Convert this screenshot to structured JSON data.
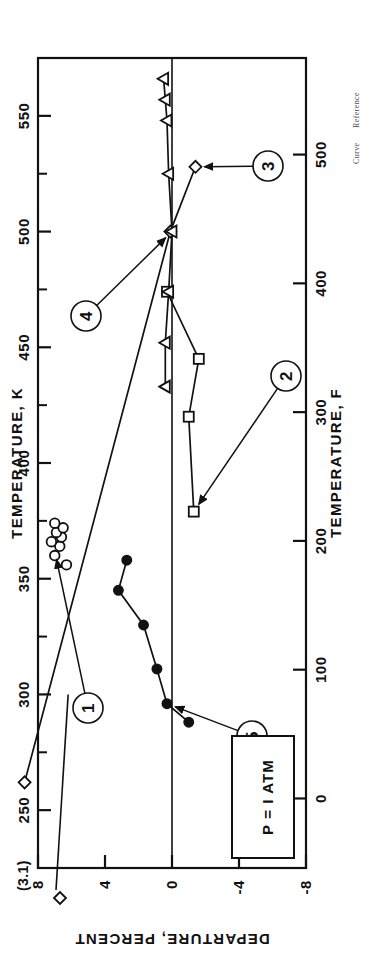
{
  "figure": {
    "note_box_label": "P = I ATM",
    "out_of_range_label": "(3.1)",
    "caption": {
      "curve_word": "Curve",
      "reference_word": "Reference"
    }
  },
  "chart_data": {
    "type": "scatter",
    "title": "",
    "xlabel": "TEMPERATURE, K",
    "xlabel_secondary": "TEMPERATURE, F",
    "ylabel": "DEPARTURE, PERCENT",
    "xlim": [
      225,
      575
    ],
    "ylim": [
      -8,
      8
    ],
    "xlim_f": [
      -54,
      575
    ],
    "grid": false,
    "legend_position": "none",
    "x_ticks_major": [
      250,
      300,
      350,
      400,
      450,
      500,
      550
    ],
    "x_ticklabels_major": [
      "250",
      "300",
      "350",
      "400",
      "450",
      "500",
      "550"
    ],
    "x_ticks_minor": [
      275,
      325,
      375,
      425,
      475,
      525
    ],
    "x_ticks_f": [
      0,
      100,
      200,
      300,
      400,
      500
    ],
    "x_ticklabels_f": [
      "0",
      "100",
      "200",
      "300",
      "400",
      "500"
    ],
    "y_ticks": [
      8,
      4,
      0,
      -4,
      -8
    ],
    "y_ticklabels": [
      "8",
      "4",
      "0",
      "-4",
      "-8"
    ],
    "zero_line": 0,
    "series": [
      {
        "name": "1",
        "marker": "open-circle",
        "connected": false,
        "callout": "1",
        "points": [
          {
            "x": 360,
            "y": 7.0
          },
          {
            "x": 364,
            "y": 6.7
          },
          {
            "x": 366,
            "y": 7.2
          },
          {
            "x": 368,
            "y": 6.6
          },
          {
            "x": 370,
            "y": 6.9
          },
          {
            "x": 372,
            "y": 6.5
          },
          {
            "x": 374,
            "y": 7.0
          },
          {
            "x": 356,
            "y": 6.3
          }
        ]
      },
      {
        "name": "2",
        "marker": "open-square",
        "connected": true,
        "callout": "2",
        "points": [
          {
            "x": 379,
            "y": -1.3
          },
          {
            "x": 420,
            "y": -1.0
          },
          {
            "x": 445,
            "y": -1.6
          },
          {
            "x": 474,
            "y": 0.3
          }
        ]
      },
      {
        "name": "3",
        "marker": "open-diamond",
        "connected": true,
        "callout": "3",
        "points": [
          {
            "x": 262,
            "y": 8.8
          },
          {
            "x": 500,
            "y": 0.1
          },
          {
            "x": 528,
            "y": -1.4
          }
        ]
      },
      {
        "name": "4",
        "marker": "open-triangle-left",
        "connected": true,
        "callout": "4",
        "points": [
          {
            "x": 433,
            "y": 0.4
          },
          {
            "x": 452,
            "y": 0.4
          },
          {
            "x": 474,
            "y": 0.2
          },
          {
            "x": 500,
            "y": 0.0
          },
          {
            "x": 525,
            "y": 0.2
          },
          {
            "x": 548,
            "y": 0.3
          },
          {
            "x": 557,
            "y": 0.4
          },
          {
            "x": 566,
            "y": 0.5
          }
        ]
      },
      {
        "name": "5",
        "marker": "filled-circle",
        "connected": true,
        "callout": "5",
        "points": [
          {
            "x": 288,
            "y": -1.0
          },
          {
            "x": 296,
            "y": 0.3
          },
          {
            "x": 311,
            "y": 0.9
          },
          {
            "x": 330,
            "y": 1.7
          },
          {
            "x": 345,
            "y": 3.2
          },
          {
            "x": 358,
            "y": 2.7
          }
        ]
      }
    ],
    "annotations": [
      {
        "text": "(3.1)",
        "x": 262,
        "y": 8.8
      },
      {
        "text": "P = I ATM",
        "x": 248,
        "y": 6.6
      }
    ]
  }
}
